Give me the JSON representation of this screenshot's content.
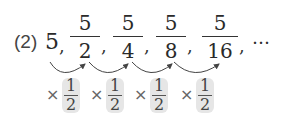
{
  "problem_label": "(2)",
  "sequence": {
    "first_term": "5",
    "separator": ",",
    "terms": [
      {
        "numerator": "5",
        "denominator": "2"
      },
      {
        "numerator": "5",
        "denominator": "4"
      },
      {
        "numerator": "5",
        "denominator": "8"
      },
      {
        "numerator": "5",
        "denominator": "16"
      }
    ],
    "ellipsis": "…"
  },
  "ratio": {
    "operator": "×",
    "numerator": "1",
    "denominator": "2",
    "count": 4
  },
  "colors": {
    "highlight": "#e6e6e6",
    "arrow": "#444444"
  }
}
